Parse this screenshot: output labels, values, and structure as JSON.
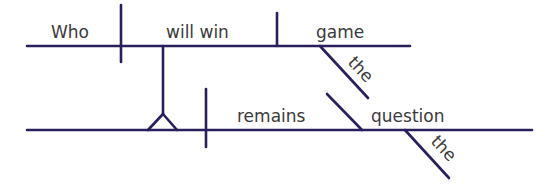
{
  "diagram": {
    "type": "sentence-diagram",
    "sentence": "Who will win the game remains the question",
    "line_color": "#2a1f5c",
    "text_color": "#3a3a3a",
    "clause": {
      "subject": "Who",
      "verb": "will win",
      "object": "game",
      "object_modifier": "the"
    },
    "main": {
      "verb": "remains",
      "complement": "question",
      "complement_modifier": "the"
    }
  }
}
